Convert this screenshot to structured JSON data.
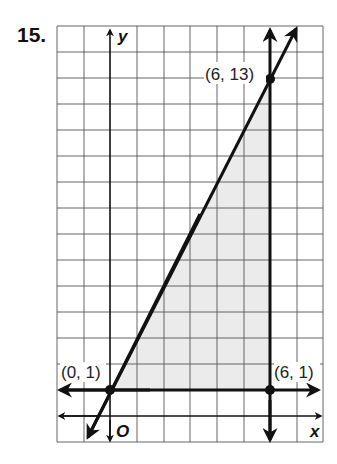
{
  "problem": {
    "number": "15."
  },
  "graph": {
    "x_axis_label": "x",
    "y_axis_label": "y",
    "origin_label": "O",
    "grid": {
      "x_min": -2,
      "x_max": 8,
      "y_min": -1,
      "y_max": 15
    },
    "shaded_region_color": "#ececec",
    "vertices": [
      {
        "label": "(0, 1)",
        "x": 0,
        "y": 1
      },
      {
        "label": "(6, 13)",
        "x": 6,
        "y": 13
      },
      {
        "label": "(6, 1)",
        "x": 6,
        "y": 1
      }
    ],
    "boundary_lines": [
      {
        "name": "y = 2x + 1"
      },
      {
        "name": "x = 6"
      },
      {
        "name": "y = 1"
      }
    ]
  }
}
